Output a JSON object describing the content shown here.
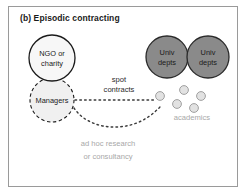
{
  "figure": {
    "title": "(b) Episodic contracting",
    "frame_color": "#9a9a9a",
    "background": "#ffffff"
  },
  "nodes": {
    "ngo": {
      "line1": "NGO or",
      "line2": "charity",
      "fill": "#f7f7f7",
      "stroke": "#1a1a1a",
      "stroke_style": "solid"
    },
    "managers": {
      "label": "Managers",
      "fill": "#f0f0f0",
      "stroke": "#1a1a1a",
      "stroke_style": "dashed"
    },
    "univ_dept_1": {
      "line1": "Univ",
      "line2": "depts",
      "fill": "#8a8a8a",
      "stroke": "#2a2a2a",
      "stroke_style": "solid"
    },
    "univ_dept_2": {
      "line1": "Univ",
      "line2": "depts",
      "fill": "#8a8a8a",
      "stroke": "#2a2a2a",
      "stroke_style": "solid"
    }
  },
  "academics": {
    "label": "academics",
    "dot_fill": "#e2e2e2",
    "dot_stroke": "#a0a0a0",
    "count": 5
  },
  "edges": {
    "spot_contracts": {
      "line1": "spot",
      "line2": "contracts",
      "style": "dotted"
    },
    "ad_hoc": {
      "line1": "ad hoc research",
      "line2": "or consultancy",
      "style": "dotted"
    }
  }
}
